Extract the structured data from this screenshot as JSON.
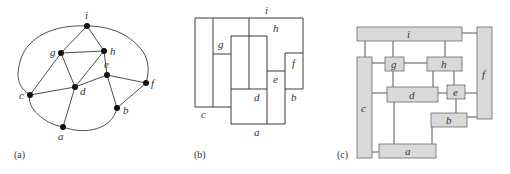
{
  "figure": {
    "panels": [
      {
        "id": "a",
        "caption": "(a)",
        "kind": "planar-graph"
      },
      {
        "id": "b",
        "caption": "(b)",
        "kind": "rectangular-dual"
      },
      {
        "id": "c",
        "caption": "(c)",
        "kind": "floorplan-with-connections"
      }
    ]
  },
  "graph": {
    "nodes": [
      {
        "id": "i",
        "label": "i",
        "x": 87,
        "y": 26
      },
      {
        "id": "g",
        "label": "g",
        "x": 61,
        "y": 53
      },
      {
        "id": "h",
        "label": "h",
        "x": 104,
        "y": 51
      },
      {
        "id": "e",
        "label": "e",
        "x": 107,
        "y": 75
      },
      {
        "id": "f",
        "label": "f",
        "x": 146,
        "y": 83
      },
      {
        "id": "d",
        "label": "d",
        "x": 75,
        "y": 87
      },
      {
        "id": "c",
        "label": "c",
        "x": 30,
        "y": 95
      },
      {
        "id": "b",
        "label": "b",
        "x": 117,
        "y": 108
      },
      {
        "id": "a",
        "label": "a",
        "x": 63,
        "y": 127
      }
    ],
    "edges": [
      [
        "i",
        "g"
      ],
      [
        "i",
        "h"
      ],
      [
        "g",
        "h"
      ],
      [
        "g",
        "d"
      ],
      [
        "g",
        "c"
      ],
      [
        "h",
        "d"
      ],
      [
        "h",
        "e"
      ],
      [
        "c",
        "d"
      ],
      [
        "d",
        "e"
      ],
      [
        "d",
        "a"
      ],
      [
        "e",
        "f"
      ],
      [
        "e",
        "b"
      ],
      [
        "f",
        "b"
      ],
      [
        "i",
        "c"
      ],
      [
        "i",
        "f"
      ],
      [
        "c",
        "a"
      ],
      [
        "a",
        "b"
      ]
    ]
  },
  "dual": {
    "labels": {
      "i": "i",
      "h": "h",
      "g": "g",
      "f": "f",
      "e": "e",
      "d": "d",
      "c": "c",
      "b": "b",
      "a": "a"
    }
  },
  "floorplan": {
    "blocks": [
      {
        "id": "i",
        "label": "i"
      },
      {
        "id": "f",
        "label": "f"
      },
      {
        "id": "c",
        "label": "c"
      },
      {
        "id": "g",
        "label": "g"
      },
      {
        "id": "h",
        "label": "h"
      },
      {
        "id": "d",
        "label": "d"
      },
      {
        "id": "e",
        "label": "e"
      },
      {
        "id": "b",
        "label": "b"
      },
      {
        "id": "a",
        "label": "a"
      }
    ],
    "fill_color": "#d9d9d9"
  }
}
